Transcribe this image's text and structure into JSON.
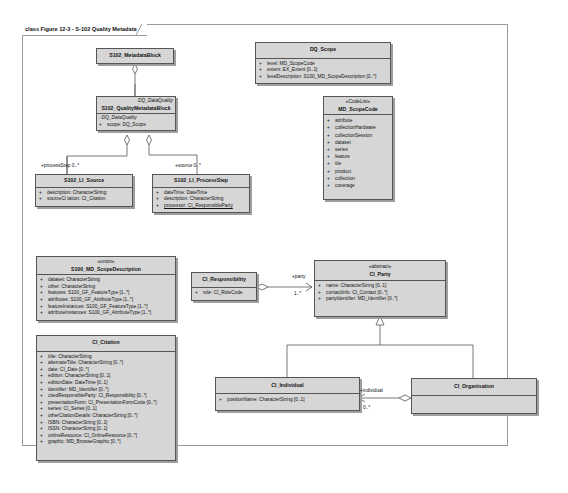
{
  "frame": {
    "title": "class Figure 12-3 - S-102 Quality Metadata"
  },
  "classes": {
    "metadata_block": {
      "name": "S102_MetadataBlock"
    },
    "quality_metadata_block": {
      "parent": "DQ_DataQuality",
      "name": "S102_QualityMetadataBlock",
      "inherited": "::DQ_DataQuality",
      "attrs": [
        {
          "vis": "+",
          "text": "scope:  DQ_Scope"
        }
      ]
    },
    "li_source": {
      "name": "S102_LI_Source",
      "attrs": [
        {
          "vis": "+",
          "text": "description:  CharacterString"
        },
        {
          "vis": "+",
          "text": "sourceCi tation:  CI_Citation"
        }
      ]
    },
    "li_processstep": {
      "name": "S102_LI_ProcessStep",
      "attrs": [
        {
          "vis": "+",
          "text": "dateTime:  DateTime"
        },
        {
          "vis": "+",
          "text": "description:  CharacterString"
        },
        {
          "vis": "+",
          "text": "processor:  CI_ResponsibleParty"
        }
      ]
    },
    "dq_scope": {
      "name": "DQ_Scope",
      "attrs": [
        {
          "vis": "+",
          "text": "level:  MD_ScopeCode"
        },
        {
          "vis": "+",
          "text": "extent:  EX_Extent [0..1]"
        },
        {
          "vis": "+",
          "text": "levelDescription:  S100_MD_ScopeDescription [0..*]"
        }
      ]
    },
    "md_scopecode": {
      "stereotype": "«CodeList»",
      "name": "MD_ScopeCode",
      "attrs": [
        {
          "vis": "+",
          "text": "attribute"
        },
        {
          "vis": "+",
          "text": "collectionHardware"
        },
        {
          "vis": "+",
          "text": "collectionSession"
        },
        {
          "vis": "+",
          "text": "dataset"
        },
        {
          "vis": "+",
          "text": "series"
        },
        {
          "vis": "+",
          "text": "feature"
        },
        {
          "vis": "+",
          "text": "tile"
        },
        {
          "vis": "+",
          "text": "product"
        },
        {
          "vis": "+",
          "text": "collection"
        },
        {
          "vis": "+",
          "text": "coverage"
        }
      ]
    },
    "scope_description": {
      "stereotype": "«union»",
      "name": "S100_MD_ScopeDescription",
      "attrs": [
        {
          "vis": "+",
          "text": "dataset:  CharacterString"
        },
        {
          "vis": "+",
          "text": "other:  CharacterString"
        },
        {
          "vis": "+",
          "text": "features:  S100_GF_FeatureType [1..*]"
        },
        {
          "vis": "+",
          "text": "attributes:  S100_GF_AttributeType [1..*]"
        },
        {
          "vis": "+",
          "text": "featureInstances:  S100_GF_FeatureType [1..*]"
        },
        {
          "vis": "+",
          "text": "attributeInstances:  S100_GF_AttributeType [1..*]"
        }
      ]
    },
    "ci_citation": {
      "name": "CI_Citation",
      "attrs": [
        {
          "vis": "+",
          "text": "title:  CharacterString"
        },
        {
          "vis": "+",
          "text": "alternateTitle:  CharacterString [0..*]"
        },
        {
          "vis": "+",
          "text": "date:  CI_Date [0..*]"
        },
        {
          "vis": "+",
          "text": "edition:  CharacterString [0..1]"
        },
        {
          "vis": "+",
          "text": "editionDate:  DateTime [0..1]"
        },
        {
          "vis": "+",
          "text": "identifier:  MD_Identifier [0..*]"
        },
        {
          "vis": "+",
          "text": "citedResponsibleParty:  CI_Responsibility [0..*]"
        },
        {
          "vis": "+",
          "text": "presentationForm:  CI_PresentationFormCode [0..*]"
        },
        {
          "vis": "+",
          "text": "series:  CI_Series [0..1]"
        },
        {
          "vis": "+",
          "text": "otherCitationDetails:  CharacterString [0..*]"
        },
        {
          "vis": "+",
          "text": "ISBN:  CharacterString [0..1]"
        },
        {
          "vis": "+",
          "text": "ISSN:  CharacterString [0..1]"
        },
        {
          "vis": "+",
          "text": "onlineResource:  CI_OnlineResource [0..*]"
        },
        {
          "vis": "+",
          "text": "graphic:  MD_BrowseGraphic [0..*]"
        }
      ]
    },
    "ci_responsibility": {
      "name": "CI_Responsibility",
      "attrs": [
        {
          "vis": "+",
          "text": "role:  CI_RoleCode"
        }
      ]
    },
    "ci_party": {
      "stereotype": "«abstract»",
      "name": "CI_Party",
      "attrs": [
        {
          "vis": "+",
          "text": "name:  CharacterString [0..1]"
        },
        {
          "vis": "+",
          "text": "contactInfo:  CI_Contact [0..*]"
        },
        {
          "vis": "+",
          "text": "partyIdentifier:  MD_Identifier [0..*]"
        }
      ]
    },
    "ci_individual": {
      "name": "CI_Individual",
      "attrs": [
        {
          "vis": "+",
          "text": "positionName:  CharacterString [0..1]"
        }
      ]
    },
    "ci_organisation": {
      "name": "CI_Organisation"
    }
  },
  "associations": {
    "process_step": {
      "role": "+processStep",
      "mult": "0..*"
    },
    "source": {
      "role": "+source",
      "mult": "0..*"
    },
    "party": {
      "role": "+party",
      "mult": "1..*"
    },
    "individual": {
      "role": "+individual",
      "mult": "0..*"
    }
  }
}
